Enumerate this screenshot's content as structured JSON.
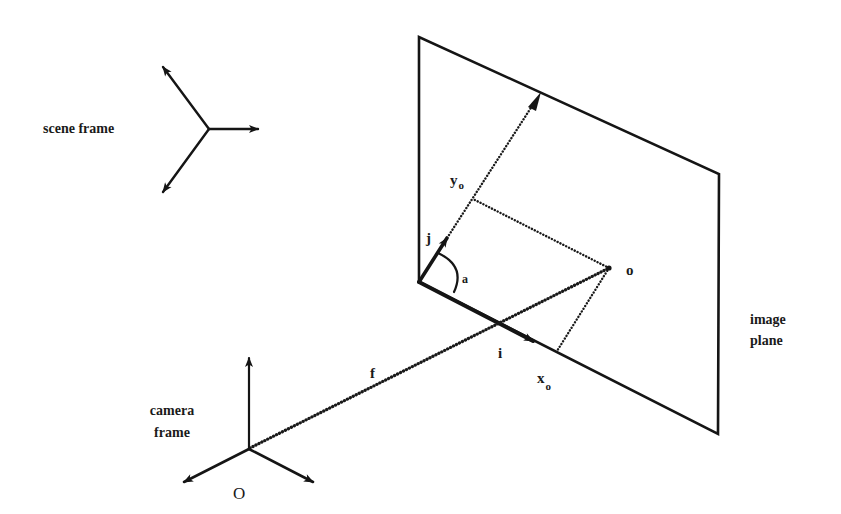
{
  "diagram": {
    "labels": {
      "scene_frame": "scene frame",
      "camera_frame_line1": "camera",
      "camera_frame_line2": "frame",
      "image_plane_line1": "image",
      "image_plane_line2": "plane",
      "origin": "O",
      "image_point": "o",
      "focal_length": "f",
      "unit_i": "i",
      "unit_j": "j",
      "angle": "a",
      "x_coord_base": "x",
      "x_coord_sub": "o",
      "y_coord_base": "y",
      "y_coord_sub": "o"
    },
    "nodes": [
      {
        "id": "scene-frame",
        "label": "scene frame",
        "kind": "coordinate-frame",
        "axes": 3
      },
      {
        "id": "camera-frame",
        "label": "camera frame",
        "kind": "coordinate-frame",
        "axes": 3,
        "origin_label": "O"
      },
      {
        "id": "image-plane",
        "label": "image plane",
        "kind": "plane"
      },
      {
        "id": "image-point",
        "label": "o",
        "kind": "point"
      }
    ],
    "edges": [
      {
        "from": "camera-frame",
        "to": "image-point",
        "label": "f",
        "style": "heavy-dotted"
      },
      {
        "from": "image-plane-corner",
        "to": "x-axis",
        "label": "i",
        "style": "vector"
      },
      {
        "from": "image-plane-corner",
        "to": "y-axis",
        "label": "j",
        "style": "vector"
      },
      {
        "from": "image-point",
        "to": "x-axis-foot",
        "label": "x_o",
        "style": "dotted"
      },
      {
        "from": "image-point",
        "to": "y-axis-foot",
        "label": "y_o",
        "style": "dotted"
      }
    ],
    "colors": {
      "ink": "#151515",
      "background": "#ffffff"
    }
  }
}
